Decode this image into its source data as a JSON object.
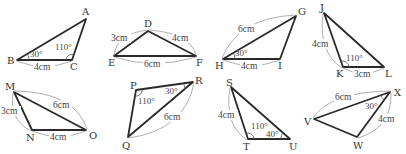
{
  "figure": {
    "colors": {
      "edge": "#2a2a2a",
      "dimension_arc": "#9a9a9a",
      "text": "#333333",
      "background": "#ffffff"
    }
  },
  "triangles": [
    {
      "id": "ABC",
      "vertices": {
        "A": {
          "label": "A",
          "x": 86,
          "y": 19
        },
        "B": {
          "label": "B",
          "x": 17,
          "y": 60
        },
        "C": {
          "label": "C",
          "x": 72,
          "y": 60
        }
      },
      "sides": [
        {
          "between": "BC",
          "label": "4cm"
        }
      ],
      "angles": [
        {
          "at": "B",
          "label": "30°"
        },
        {
          "at": "C",
          "label": "110°"
        }
      ]
    },
    {
      "id": "DEF",
      "vertices": {
        "D": {
          "label": "D",
          "x": 148,
          "y": 31
        },
        "E": {
          "label": "E",
          "x": 114,
          "y": 56
        },
        "F": {
          "label": "F",
          "x": 196,
          "y": 56
        }
      },
      "sides": [
        {
          "between": "DE",
          "label": "3cm"
        },
        {
          "between": "DF",
          "label": "4cm"
        },
        {
          "between": "EF",
          "label": "6cm"
        }
      ],
      "angles": []
    },
    {
      "id": "GHI",
      "vertices": {
        "G": {
          "label": "G",
          "x": 296,
          "y": 16
        },
        "H": {
          "label": "H",
          "x": 223,
          "y": 59
        },
        "I": {
          "label": "I",
          "x": 280,
          "y": 59
        }
      },
      "sides": [
        {
          "between": "GH",
          "label": "6cm"
        },
        {
          "between": "HI",
          "label": "4cm"
        }
      ],
      "angles": [
        {
          "at": "H",
          "label": "30°"
        }
      ]
    },
    {
      "id": "JKL",
      "vertices": {
        "J": {
          "label": "J",
          "x": 324,
          "y": 13
        },
        "K": {
          "label": "K",
          "x": 343,
          "y": 67
        },
        "L": {
          "label": "L",
          "x": 384,
          "y": 67
        }
      },
      "sides": [
        {
          "between": "JK",
          "label": "4cm"
        },
        {
          "between": "KL",
          "label": "3cm"
        }
      ],
      "angles": [
        {
          "at": "K",
          "label": "110°"
        }
      ]
    },
    {
      "id": "MNO",
      "vertices": {
        "M": {
          "label": "M",
          "x": 14,
          "y": 92
        },
        "N": {
          "label": "N",
          "x": 32,
          "y": 130
        },
        "O": {
          "label": "O",
          "x": 86,
          "y": 130
        }
      },
      "sides": [
        {
          "between": "MN",
          "label": "3cm"
        },
        {
          "between": "MO",
          "label": "6cm"
        },
        {
          "between": "NO",
          "label": "4cm"
        }
      ],
      "angles": []
    },
    {
      "id": "PQR",
      "vertices": {
        "P": {
          "label": "P",
          "x": 136,
          "y": 90
        },
        "Q": {
          "label": "Q",
          "x": 128,
          "y": 137
        },
        "R": {
          "label": "R",
          "x": 193,
          "y": 82
        }
      },
      "sides": [
        {
          "between": "QR",
          "label": "6cm"
        }
      ],
      "angles": [
        {
          "at": "P",
          "label": "110°"
        },
        {
          "at": "R",
          "label": "30°"
        }
      ]
    },
    {
      "id": "STU",
      "vertices": {
        "S": {
          "label": "S",
          "x": 231,
          "y": 87
        },
        "T": {
          "label": "T",
          "x": 248,
          "y": 139
        },
        "U": {
          "label": "U",
          "x": 290,
          "y": 139
        }
      },
      "sides": [
        {
          "between": "ST",
          "label": "4cm"
        }
      ],
      "angles": [
        {
          "at": "T",
          "label": "110°"
        },
        {
          "at": "U",
          "label": "40°"
        }
      ]
    },
    {
      "id": "VWX",
      "vertices": {
        "V": {
          "label": "V",
          "x": 314,
          "y": 119
        },
        "W": {
          "label": "W",
          "x": 357,
          "y": 137
        },
        "X": {
          "label": "X",
          "x": 390,
          "y": 92
        }
      },
      "sides": [
        {
          "between": "VX",
          "label": "6cm"
        },
        {
          "between": "WX",
          "label": "4cm"
        }
      ],
      "angles": [
        {
          "at": "X",
          "label": "30°"
        }
      ]
    }
  ]
}
